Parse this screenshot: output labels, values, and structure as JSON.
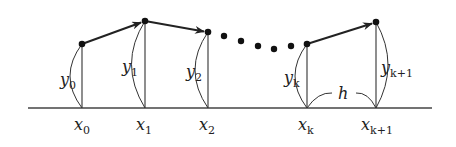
{
  "diagram": {
    "colors": {
      "ink": "#222222",
      "background": "#ffffff"
    },
    "points": [
      {
        "id": "p0",
        "x_label": "x",
        "x_sub": "0",
        "y_label": "y",
        "y_sub": "0"
      },
      {
        "id": "p1",
        "x_label": "x",
        "x_sub": "1",
        "y_label": "y",
        "y_sub": "1"
      },
      {
        "id": "p2",
        "x_label": "x",
        "x_sub": "2",
        "y_label": "y",
        "y_sub": "2"
      },
      {
        "id": "pk",
        "x_label": "x",
        "x_sub": "k",
        "y_label": "y",
        "y_sub": "k"
      },
      {
        "id": "pk1",
        "x_label": "x",
        "x_sub": "k+1",
        "y_label": "y",
        "y_sub": "k+1"
      }
    ],
    "step_label": "h",
    "ellipsis_dots": 5
  }
}
